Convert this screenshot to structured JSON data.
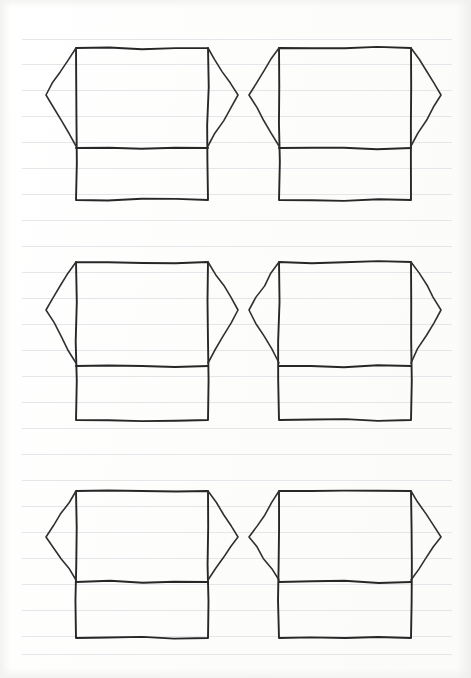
{
  "canvas": {
    "width": 471,
    "height": 678,
    "background_color": "#fdfdfd",
    "medium": "ruled notebook paper",
    "description": "Hand-drawn pen sketch sheet containing six identical garment (T-shirt / tunic) outlines arranged in a three-row by two-column grid."
  },
  "paper": {
    "rule_color": "#dfe2e6",
    "rule_spacing_px": 26,
    "rule_left_x": 22,
    "rule_right_x": 452,
    "rule_y_positions": [
      39,
      64,
      90,
      116,
      142,
      168,
      194,
      220,
      246,
      272,
      298,
      324,
      350,
      376,
      402,
      428,
      454,
      480,
      506,
      532,
      558,
      584,
      610,
      636,
      654
    ],
    "rule_count": 25
  },
  "ink": {
    "outline_color": "#272727",
    "outline_width": 1.9,
    "sleeve_color": "#303030",
    "sleeve_width": 1.6,
    "hem_width": 2.0
  },
  "grid": {
    "rows": 3,
    "columns": 2,
    "total_figures": 6,
    "column_origin_x": [
      76,
      279
    ],
    "row_origin_y": [
      48,
      262,
      478
    ]
  },
  "garment_template": {
    "label": "t-shirt outline",
    "body_width": 132,
    "body_height": 152,
    "shoulder_to_hem_px": 100,
    "hem_band_height": 52,
    "sleeve_extension_px": 30,
    "sleeve_drop_px": 48,
    "sleeve_tip_y_offset": 47,
    "parts": [
      "body-rectangle",
      "left-sleeve",
      "right-sleeve",
      "hem-line"
    ]
  },
  "figures": [
    {
      "id": "garment-1",
      "name": "garment-row1-left",
      "row": 1,
      "column": 1,
      "body": {
        "left": 76,
        "right": 208,
        "top": 48,
        "bottom": 200
      },
      "hem_y": 148,
      "left_sleeve": {
        "tip_x": 46,
        "tip_y": 95,
        "bottom_x": 76,
        "bottom_y": 146
      },
      "right_sleeve": {
        "tip_x": 238,
        "tip_y": 95,
        "bottom_x": 208,
        "bottom_y": 146
      }
    },
    {
      "id": "garment-2",
      "name": "garment-row1-right",
      "row": 1,
      "column": 2,
      "body": {
        "left": 279,
        "right": 411,
        "top": 48,
        "bottom": 200
      },
      "hem_y": 148,
      "left_sleeve": {
        "tip_x": 249,
        "tip_y": 95,
        "bottom_x": 279,
        "bottom_y": 146
      },
      "right_sleeve": {
        "tip_x": 441,
        "tip_y": 95,
        "bottom_x": 411,
        "bottom_y": 146
      }
    },
    {
      "id": "garment-3",
      "name": "garment-row2-left",
      "row": 2,
      "column": 1,
      "body": {
        "left": 76,
        "right": 208,
        "top": 262,
        "bottom": 420
      },
      "hem_y": 366,
      "left_sleeve": {
        "tip_x": 46,
        "tip_y": 310,
        "bottom_x": 76,
        "bottom_y": 363
      },
      "right_sleeve": {
        "tip_x": 238,
        "tip_y": 310,
        "bottom_x": 208,
        "bottom_y": 363
      }
    },
    {
      "id": "garment-4",
      "name": "garment-row2-right",
      "row": 2,
      "column": 2,
      "body": {
        "left": 279,
        "right": 411,
        "top": 262,
        "bottom": 420
      },
      "hem_y": 366,
      "left_sleeve": {
        "tip_x": 249,
        "tip_y": 310,
        "bottom_x": 279,
        "bottom_y": 363
      },
      "right_sleeve": {
        "tip_x": 441,
        "tip_y": 310,
        "bottom_x": 411,
        "bottom_y": 363
      }
    },
    {
      "id": "garment-5",
      "name": "garment-row3-left",
      "row": 3,
      "column": 1,
      "body": {
        "left": 76,
        "right": 208,
        "top": 491,
        "bottom": 638
      },
      "hem_y": 582,
      "left_sleeve": {
        "tip_x": 46,
        "tip_y": 537,
        "bottom_x": 76,
        "bottom_y": 580
      },
      "right_sleeve": {
        "tip_x": 238,
        "tip_y": 537,
        "bottom_x": 208,
        "bottom_y": 580
      }
    },
    {
      "id": "garment-6",
      "name": "garment-row3-right",
      "row": 3,
      "column": 2,
      "body": {
        "left": 279,
        "right": 411,
        "top": 491,
        "bottom": 638
      },
      "hem_y": 582,
      "left_sleeve": {
        "tip_x": 249,
        "tip_y": 537,
        "bottom_x": 279,
        "bottom_y": 580
      },
      "right_sleeve": {
        "tip_x": 441,
        "tip_y": 537,
        "bottom_x": 411,
        "bottom_y": 580
      }
    }
  ]
}
